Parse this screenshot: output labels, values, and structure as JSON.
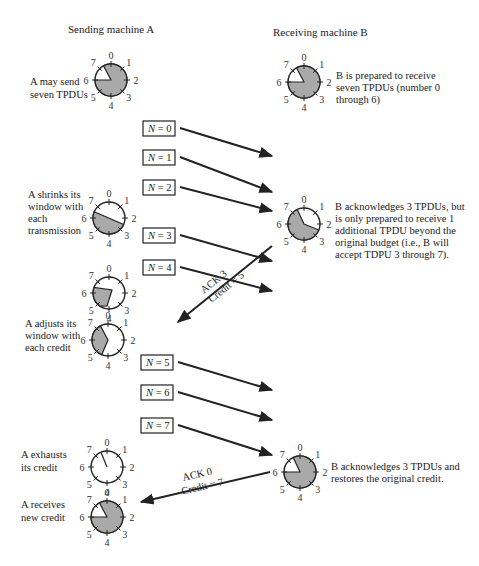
{
  "headers": {
    "sender": "Sending machine A",
    "receiver": "Receiving machine B"
  },
  "colors": {
    "shade": "#a9a9a9",
    "line": "#222222",
    "background": "#ffffff"
  },
  "dial_labels": [
    "0",
    "1",
    "2",
    "3",
    "4",
    "5",
    "6",
    "7"
  ],
  "sender_notes": [
    {
      "lines": [
        "A may send",
        "seven TPDUs"
      ]
    },
    {
      "lines": [
        "A shrinks its",
        "window with",
        "each",
        "transmission"
      ]
    },
    {
      "lines": [
        "A adjusts its",
        "window with",
        "each credit"
      ]
    },
    {
      "lines": [
        "A exhausts",
        "its credit"
      ]
    },
    {
      "lines": [
        "A receives",
        "new credit"
      ]
    }
  ],
  "receiver_notes": [
    {
      "lines": [
        "B is prepared to receive",
        "seven TPDUs (number 0",
        "through 6)"
      ]
    },
    {
      "lines": [
        "B acknowledges 3 TPDUs, but",
        "is only prepared to receive 1",
        "additional TPDU beyond the",
        "original budget (i.e., B will",
        "accept TDPU 3 through 7)."
      ]
    },
    {
      "lines": [
        "B acknowledges 3 TPDUs and",
        "restores the original credit."
      ]
    }
  ],
  "messages": [
    {
      "var": "N",
      "eq": "= 0"
    },
    {
      "var": "N",
      "eq": "= 1"
    },
    {
      "var": "N",
      "eq": "= 2"
    },
    {
      "var": "N",
      "eq": "= 3"
    },
    {
      "var": "N",
      "eq": "= 4"
    },
    {
      "var": "N",
      "eq": "= 5"
    },
    {
      "var": "N",
      "eq": "= 6"
    },
    {
      "var": "N",
      "eq": "= 7"
    }
  ],
  "acks": [
    {
      "ack": "ACK 3",
      "credit": "Credit = 5"
    },
    {
      "ack": "ACK 0",
      "credit": "Credit = 7"
    }
  ]
}
